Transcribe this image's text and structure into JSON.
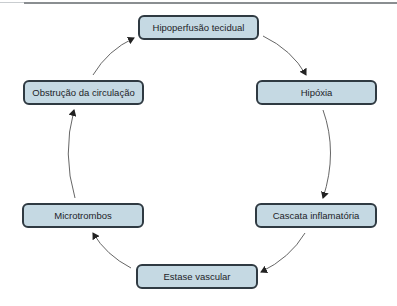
{
  "diagram": {
    "type": "cycle",
    "nodes": [
      {
        "id": "hipoperfusao",
        "label": "Hipoperfusão tecidual"
      },
      {
        "id": "hipoxia",
        "label": "Hipóxia"
      },
      {
        "id": "cascata",
        "label": "Cascata inflamatória"
      },
      {
        "id": "estase",
        "label": "Estase vascular"
      },
      {
        "id": "microtrombos",
        "label": "Microtrombos"
      },
      {
        "id": "obstrucao",
        "label": "Obstrução da circulação"
      }
    ],
    "edges": [
      {
        "from": "hipoperfusao",
        "to": "hipoxia"
      },
      {
        "from": "hipoxia",
        "to": "cascata"
      },
      {
        "from": "cascata",
        "to": "estase"
      },
      {
        "from": "estase",
        "to": "microtrombos"
      },
      {
        "from": "microtrombos",
        "to": "obstrucao"
      },
      {
        "from": "obstrucao",
        "to": "hipoperfusao"
      }
    ],
    "colors": {
      "node_fill": "#c5d9e3",
      "node_border": "#2f3a42",
      "arrow": "#555555"
    }
  }
}
